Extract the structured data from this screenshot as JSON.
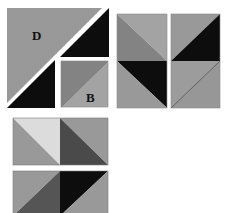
{
  "figure": {
    "labels": {
      "large_square": "D",
      "small_square": "B"
    },
    "colors": {
      "background": "#ffffff",
      "black": "#0d0d0d",
      "dark_gray": "#4a4a4a",
      "mid_dark_gray": "#838383",
      "mid_gray": "#999999",
      "light_gray": "#a3a3a3",
      "very_light_gray": "#dcdcdc",
      "edge": "#6e6e6e"
    },
    "pieces": [
      {
        "name": "large-square-D",
        "label": "D",
        "halves": [
          "mid_gray",
          "black"
        ],
        "cut": "white diagonal gap, small square B inset bottom-right"
      },
      {
        "name": "small-square-B",
        "label": "B",
        "halves": [
          "mid_dark_gray",
          "light_gray"
        ]
      },
      {
        "name": "vertical-pair-1",
        "units": [
          {
            "upper_right": "light_gray",
            "lower_left": "mid_dark_gray"
          },
          {
            "upper_right": "black",
            "lower_left": "mid_gray"
          }
        ]
      },
      {
        "name": "vertical-pair-2",
        "units": [
          {
            "upper_left": "mid_gray",
            "lower_right": "black"
          },
          {
            "upper_left": "mid_gray",
            "lower_right": "mid_gray"
          }
        ]
      },
      {
        "name": "horizontal-pair-1",
        "units": [
          {
            "upper_right": "very_light_gray",
            "lower_left": "mid_gray"
          },
          {
            "upper_right": "mid_gray",
            "lower_left": "dark_gray"
          }
        ]
      },
      {
        "name": "horizontal-pair-2",
        "units": [
          {
            "upper_left": "mid_gray",
            "lower_right": "dark_gray"
          },
          {
            "upper_left": "black",
            "lower_right": "mid_gray"
          }
        ]
      }
    ]
  }
}
